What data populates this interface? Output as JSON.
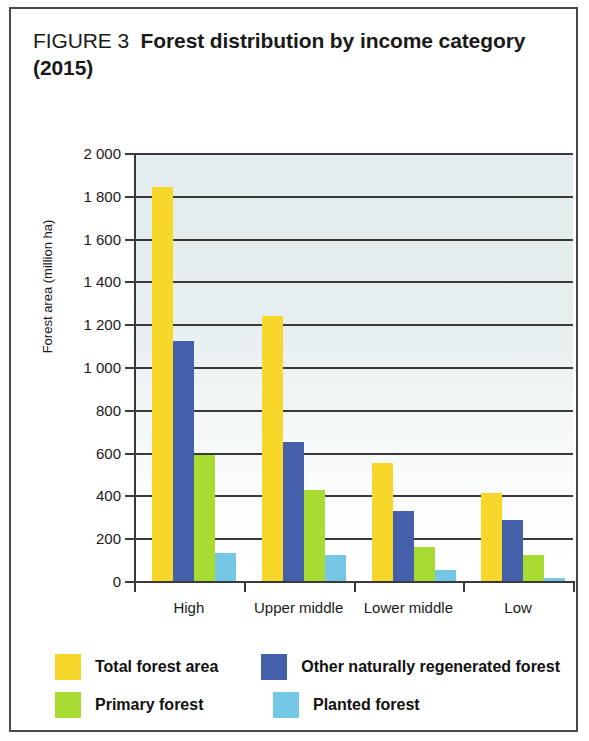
{
  "figure": {
    "number_label": "FIGURE 3",
    "caption": "Forest distribution by income category (2015)"
  },
  "chart_data": {
    "type": "bar",
    "title": "Forest distribution by income category (2015)",
    "xlabel": "",
    "ylabel": "Forest area (million ha)",
    "ylim": [
      0,
      2000
    ],
    "ytick_step": 200,
    "ytick_labels": [
      "0",
      "200",
      "400",
      "600",
      "800",
      "1 000",
      "1 200",
      "1 400",
      "1 600",
      "1 800",
      "2 000"
    ],
    "ytick_values": [
      0,
      200,
      400,
      600,
      800,
      1000,
      1200,
      1400,
      1600,
      1800,
      2000
    ],
    "grid": true,
    "legend_position": "bottom",
    "categories": [
      "High",
      "Upper middle",
      "Lower middle",
      "Low"
    ],
    "series": [
      {
        "name": "Total forest area",
        "color": "#F8D72B",
        "values": [
          1840,
          1240,
          550,
          410
        ]
      },
      {
        "name": "Other naturally regenerated forest",
        "color": "#4460AB",
        "values": [
          1120,
          650,
          325,
          285
        ]
      },
      {
        "name": "Primary forest",
        "color": "#A8DC32",
        "values": [
          590,
          425,
          160,
          120
        ]
      },
      {
        "name": "Planted forest",
        "color": "#74C8E6",
        "values": [
          130,
          120,
          50,
          15
        ]
      }
    ]
  }
}
